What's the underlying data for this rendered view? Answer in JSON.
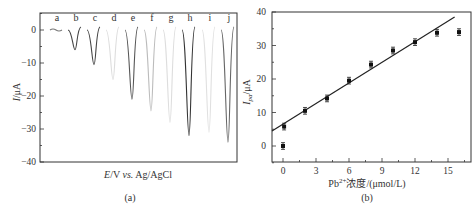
{
  "chart_data": [
    {
      "type": "line",
      "panel": "(a)",
      "xlabel": "E/V vs. Ag/AgCl",
      "ylabel": "I/μA",
      "ylim": [
        -40,
        5
      ],
      "yticks": [
        0,
        -10,
        -20,
        -30,
        -40
      ],
      "series": [
        {
          "name": "a",
          "peak": -0.5,
          "color": "#777777"
        },
        {
          "name": "b",
          "peak": -6,
          "color": "#444444"
        },
        {
          "name": "c",
          "peak": -10.5,
          "color": "#444444"
        },
        {
          "name": "d",
          "peak": -15,
          "color": "#dddddd"
        },
        {
          "name": "e",
          "peak": -21,
          "color": "#555555"
        },
        {
          "name": "f",
          "peak": -24.5,
          "color": "#bbbbbb"
        },
        {
          "name": "g",
          "peak": -28,
          "color": "#dddddd"
        },
        {
          "name": "h",
          "peak": -32,
          "color": "#333333"
        },
        {
          "name": "i",
          "peak": -31,
          "color": "#e0e0e0"
        },
        {
          "name": "j",
          "peak": -34,
          "color": "#666666"
        }
      ]
    },
    {
      "type": "scatter",
      "panel": "(b)",
      "xlabel": "Pb2+浓度/(μmol/L)",
      "ylabel": "Ipa/μA",
      "xlim": [
        -1,
        17
      ],
      "ylim": [
        -5,
        40
      ],
      "xticks": [
        0,
        3,
        6,
        9,
        12,
        15
      ],
      "yticks": [
        0,
        10,
        20,
        30,
        40
      ],
      "points": [
        {
          "x": 0,
          "y": 0,
          "err": 1
        },
        {
          "x": 0.1,
          "y": 5.8,
          "err": 1
        },
        {
          "x": 2,
          "y": 10.5,
          "err": 1
        },
        {
          "x": 4,
          "y": 14.2,
          "err": 1
        },
        {
          "x": 6,
          "y": 19.5,
          "err": 1
        },
        {
          "x": 8,
          "y": 24.3,
          "err": 1
        },
        {
          "x": 10,
          "y": 28.5,
          "err": 1
        },
        {
          "x": 12,
          "y": 31,
          "err": 1
        },
        {
          "x": 14,
          "y": 33.8,
          "err": 1
        },
        {
          "x": 16,
          "y": 34,
          "err": 1
        }
      ],
      "fit_line": {
        "x0": -1,
        "y0": 4.5,
        "x1": 15.6,
        "y1": 38.5
      }
    }
  ],
  "labels": {
    "a_xlabel_E": "E",
    "a_xlabel_rest": "/V ",
    "a_xlabel_vs": "vs.",
    "a_xlabel_ref": " Ag/AgCl",
    "a_ylabel": "I/μA",
    "a_caption": "(a)",
    "b_xlabel_pb": "Pb",
    "b_xlabel_sup": "2+",
    "b_xlabel_rest": "浓度/(μmol/L)",
    "b_ylabel_main": "I",
    "b_ylabel_sub": "pa",
    "b_ylabel_unit": "/μA",
    "b_caption": "(b)"
  }
}
